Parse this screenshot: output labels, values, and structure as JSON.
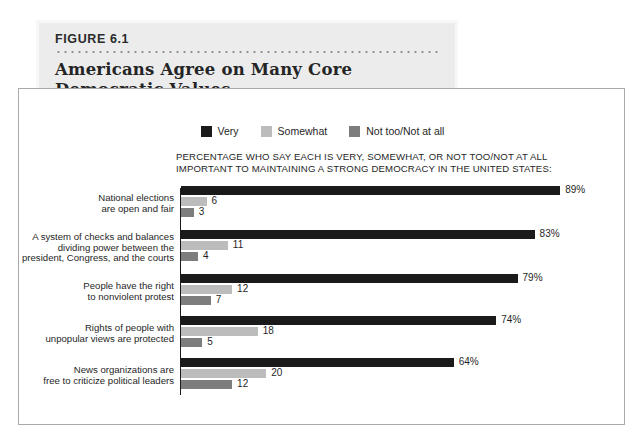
{
  "figure": {
    "number": "FIGURE 6.1",
    "title_line1": "Americans Agree on Many Core",
    "title_line2": "Democratic Values"
  },
  "legend": {
    "items": [
      {
        "label": "Very",
        "color": "#1a1a1a"
      },
      {
        "label": "Somewhat",
        "color": "#bcbcbc"
      },
      {
        "label": "Not too/Not at all",
        "color": "#7d7d7d"
      }
    ]
  },
  "subtitle": {
    "line1": "PERCENTAGE WHO SAY EACH IS VERY, SOMEWHAT, OR NOT TOO/NOT AT ALL",
    "line2": "IMPORTANT TO MAINTAINING A STRONG DEMOCRACY IN THE UNITED STATES:"
  },
  "chart_data": {
    "type": "bar",
    "orientation": "horizontal",
    "title": "Americans Agree on Many Core Democratic Values",
    "subtitle": "PERCENTAGE WHO SAY EACH IS VERY, SOMEWHAT, OR NOT TOO/NOT AT ALL IMPORTANT TO MAINTAINING A STRONG DEMOCRACY IN THE UNITED STATES:",
    "xlabel": "",
    "ylabel": "",
    "xlim": [
      0,
      100
    ],
    "grid": false,
    "legend_position": "top-center",
    "categories": [
      "National elections are open and fair",
      "A system of checks and balances dividing power between the president, Congress, and the courts",
      "People have the right to nonviolent protest",
      "Rights of people with unpopular views are protected",
      "News organizations are free to criticize political leaders"
    ],
    "series": [
      {
        "name": "Very",
        "color": "#1a1a1a",
        "values": [
          89,
          83,
          79,
          74,
          64
        ],
        "labels": [
          "89%",
          "83%",
          "79%",
          "74%",
          "64%"
        ]
      },
      {
        "name": "Somewhat",
        "color": "#bcbcbc",
        "values": [
          6,
          11,
          12,
          18,
          20
        ],
        "labels": [
          "6",
          "11",
          "12",
          "18",
          "20"
        ]
      },
      {
        "name": "Not too/Not at all",
        "color": "#7d7d7d",
        "values": [
          3,
          4,
          7,
          5,
          12
        ],
        "labels": [
          "3",
          "4",
          "7",
          "5",
          "12"
        ]
      }
    ]
  },
  "groups": [
    {
      "label_lines": [
        "National elections",
        "are open and fair"
      ],
      "bars": [
        {
          "series": "Very",
          "value": 89,
          "label": "89%"
        },
        {
          "series": "Somewhat",
          "value": 6,
          "label": "6"
        },
        {
          "series": "Not too/Not at all",
          "value": 3,
          "label": "3"
        }
      ]
    },
    {
      "label_lines": [
        "A system of checks and balances",
        "dividing power between the",
        "president, Congress, and the courts"
      ],
      "bars": [
        {
          "series": "Very",
          "value": 83,
          "label": "83%"
        },
        {
          "series": "Somewhat",
          "value": 11,
          "label": "11"
        },
        {
          "series": "Not too/Not at all",
          "value": 4,
          "label": "4"
        }
      ]
    },
    {
      "label_lines": [
        "People have the right",
        "to nonviolent protest"
      ],
      "bars": [
        {
          "series": "Very",
          "value": 79,
          "label": "79%"
        },
        {
          "series": "Somewhat",
          "value": 12,
          "label": "12"
        },
        {
          "series": "Not too/Not at all",
          "value": 7,
          "label": "7"
        }
      ]
    },
    {
      "label_lines": [
        "Rights of people with",
        "unpopular views are protected"
      ],
      "bars": [
        {
          "series": "Very",
          "value": 74,
          "label": "74%"
        },
        {
          "series": "Somewhat",
          "value": 18,
          "label": "18"
        },
        {
          "series": "Not too/Not at all",
          "value": 5,
          "label": "5"
        }
      ]
    },
    {
      "label_lines": [
        "News organizations are",
        "free to criticize political leaders"
      ],
      "bars": [
        {
          "series": "Very",
          "value": 64,
          "label": "64%"
        },
        {
          "series": "Somewhat",
          "value": 20,
          "label": "20"
        },
        {
          "series": "Not too/Not at all",
          "value": 12,
          "label": "12"
        }
      ]
    }
  ]
}
